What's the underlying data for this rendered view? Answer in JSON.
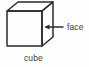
{
  "figure": {
    "background_color": "#fefefe",
    "stroke_color": "#2b2b2b",
    "text_color": "#3a3a3a",
    "labels": {
      "face": "face",
      "cube": "cube"
    },
    "shape": {
      "name": "cube",
      "style": "wireframe-isometric",
      "front_face": {
        "x": 7,
        "y": 11,
        "width": 35,
        "height": 35
      },
      "depth_offset": {
        "dx": 11,
        "dy": -9
      }
    },
    "annotation": {
      "name": "face-pointer",
      "type": "arrow",
      "direction": "left",
      "from_x": 63,
      "to_x": 45,
      "y": 27
    }
  }
}
